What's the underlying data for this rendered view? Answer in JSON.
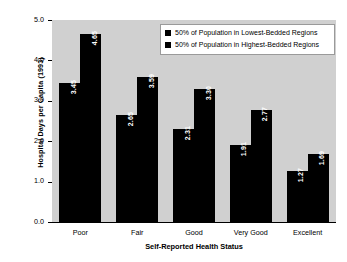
{
  "chart_data": {
    "type": "bar",
    "title": "",
    "subtitle": "",
    "xlabel": "Self-Reported Health Status",
    "ylabel": "Hospital Days per Capita (1993)",
    "categories": [
      "Poor",
      "Fair",
      "Good",
      "Very Good",
      "Excellent"
    ],
    "series": [
      {
        "name": "50% of Population in Lowest-Bedded Regions",
        "color": "#000000",
        "values": [
          3.45,
          2.65,
          2.31,
          1.91,
          1.27
        ]
      },
      {
        "name": "50% of Population in Highest-Bedded Regions",
        "color": "#000000",
        "values": [
          4.65,
          3.59,
          3.3,
          2.77,
          1.69
        ]
      }
    ],
    "ylim": [
      0.0,
      5.0
    ],
    "yticks": [
      "0.0",
      "1.0",
      "2.0",
      "3.0",
      "4.0",
      "5.0"
    ],
    "ytick_values": [
      0.0,
      1.0,
      2.0,
      3.0,
      4.0,
      5.0
    ],
    "grid": false,
    "legend_position": "upper right",
    "plot_background": "#d0d0d0",
    "canvas_background": "#ffffff",
    "bar_value_label_color": "#ffffff"
  },
  "legend": {
    "items": [
      {
        "label": "50% of Population in Lowest-Bedded Regions",
        "swatch": "legend-swatch-black"
      },
      {
        "label": "50% of Population in Highest-Bedded Regions",
        "swatch": "legend-swatch-black"
      }
    ]
  }
}
